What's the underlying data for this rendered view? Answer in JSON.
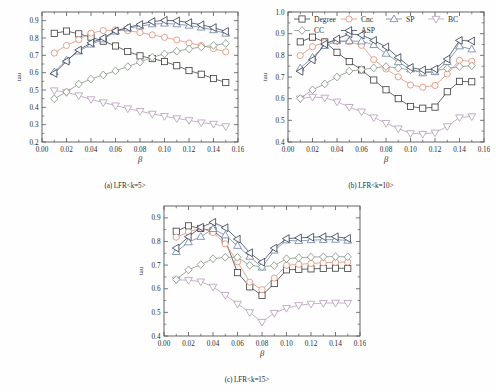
{
  "figure": {
    "xlabel": "β",
    "ylabel": "tau",
    "series_names": [
      "Degree",
      "Cnc",
      "SP",
      "BC",
      "CC",
      "ASP"
    ],
    "series_markers": [
      "square",
      "circle",
      "triangle-up",
      "triangle-down",
      "diamond",
      "triangle-left"
    ],
    "series_colors": [
      "#3a3a3a",
      "#e08a72",
      "#6b7fa3",
      "#b49ab8",
      "#7e917e",
      "#2f3b52"
    ]
  },
  "legend": {
    "row1": [
      "Degree",
      "Cnc",
      "SP",
      "BC"
    ],
    "row2": [
      "CC",
      "ASP"
    ]
  },
  "panels": [
    {
      "id": "a",
      "caption": "(a) LFR<k=5>",
      "xlabel": "β",
      "ylabel": "tau",
      "xticks": [
        "0.00",
        "0.02",
        "0.04",
        "0.06",
        "0.08",
        "0.10",
        "0.12",
        "0.14",
        "0.16"
      ],
      "yticks": [
        "0.2",
        "0.3",
        "0.4",
        "0.5",
        "0.6",
        "0.7",
        "0.8",
        "0.9"
      ]
    },
    {
      "id": "b",
      "caption": "(b) LFR<k=10>",
      "xlabel": "β",
      "ylabel": "tau",
      "xticks": [
        "0.00",
        "0.02",
        "0.04",
        "0.06",
        "0.08",
        "0.10",
        "0.12",
        "0.14",
        "0.16"
      ],
      "yticks": [
        "0.4",
        "0.5",
        "0.6",
        "0.7",
        "0.8",
        "0.9",
        "1.0"
      ]
    },
    {
      "id": "c",
      "caption": "(c) LFR<k=15>",
      "xlabel": "β",
      "ylabel": "tau",
      "xticks": [
        "0.00",
        "0.02",
        "0.04",
        "0.06",
        "0.08",
        "0.10",
        "0.12",
        "0.14",
        "0.16"
      ],
      "yticks": [
        "0.4",
        "0.5",
        "0.6",
        "0.7",
        "0.8",
        "0.9"
      ]
    }
  ],
  "chart_data": [
    {
      "type": "line",
      "panel": "a",
      "title": "(a) LFR<k=5>",
      "xlabel": "β",
      "ylabel": "tau",
      "xlim": [
        0.0,
        0.16
      ],
      "ylim": [
        0.2,
        0.95
      ],
      "grid": false,
      "legend": "none",
      "x": [
        0.01,
        0.02,
        0.03,
        0.04,
        0.05,
        0.06,
        0.07,
        0.08,
        0.09,
        0.1,
        0.11,
        0.12,
        0.13,
        0.14,
        0.15
      ],
      "series": [
        {
          "name": "Degree",
          "marker": "square",
          "color": "#3a3a3a",
          "values": [
            0.827,
            0.84,
            0.824,
            0.805,
            0.782,
            0.754,
            0.722,
            0.697,
            0.681,
            0.664,
            0.64,
            0.612,
            0.591,
            0.566,
            0.543
          ]
        },
        {
          "name": "Cnc",
          "marker": "circle",
          "color": "#e08a72",
          "values": [
            0.713,
            0.757,
            0.79,
            0.828,
            0.843,
            0.846,
            0.842,
            0.832,
            0.818,
            0.804,
            0.789,
            0.771,
            0.757,
            0.739,
            0.72
          ]
        },
        {
          "name": "SP",
          "marker": "triangle-up",
          "color": "#6b7fa3",
          "values": [
            0.604,
            0.672,
            0.723,
            0.763,
            0.793,
            0.838,
            0.856,
            0.868,
            0.88,
            0.884,
            0.88,
            0.872,
            0.861,
            0.846,
            0.826
          ]
        },
        {
          "name": "BC",
          "marker": "triangle-down",
          "color": "#b49ab8",
          "values": [
            0.497,
            0.487,
            0.468,
            0.446,
            0.428,
            0.41,
            0.393,
            0.378,
            0.362,
            0.349,
            0.336,
            0.325,
            0.312,
            0.304,
            0.29
          ]
        },
        {
          "name": "CC",
          "marker": "diamond",
          "color": "#7e917e",
          "values": [
            0.449,
            0.489,
            0.534,
            0.563,
            0.587,
            0.61,
            0.635,
            0.661,
            0.689,
            0.708,
            0.724,
            0.737,
            0.748,
            0.757,
            0.768
          ]
        },
        {
          "name": "ASP",
          "marker": "triangle-left",
          "color": "#2f3b52",
          "values": [
            0.596,
            0.666,
            0.731,
            0.772,
            0.8,
            0.841,
            0.861,
            0.878,
            0.895,
            0.902,
            0.899,
            0.889,
            0.876,
            0.86,
            0.838
          ]
        }
      ]
    },
    {
      "type": "line",
      "panel": "b",
      "title": "(b) LFR<k=10>",
      "xlabel": "β",
      "ylabel": "tau",
      "xlim": [
        0.0,
        0.16
      ],
      "ylim": [
        0.4,
        1.0
      ],
      "grid": false,
      "legend": "top-left",
      "x": [
        0.01,
        0.02,
        0.03,
        0.04,
        0.05,
        0.06,
        0.07,
        0.08,
        0.09,
        0.1,
        0.11,
        0.12,
        0.13,
        0.14,
        0.15
      ],
      "series": [
        {
          "name": "Degree",
          "marker": "square",
          "color": "#3a3a3a",
          "values": [
            0.862,
            0.884,
            0.862,
            0.814,
            0.771,
            0.733,
            0.686,
            0.641,
            0.6,
            0.564,
            0.556,
            0.561,
            0.632,
            0.68,
            0.678
          ]
        },
        {
          "name": "Cnc",
          "marker": "circle",
          "color": "#e08a72",
          "values": [
            0.799,
            0.84,
            0.86,
            0.865,
            0.863,
            0.846,
            0.78,
            0.737,
            0.701,
            0.663,
            0.653,
            0.661,
            0.714,
            0.777,
            0.772
          ]
        },
        {
          "name": "SP",
          "marker": "triangle-up",
          "color": "#6b7fa3",
          "values": [
            0.741,
            0.79,
            0.844,
            0.866,
            0.866,
            0.865,
            0.848,
            0.808,
            0.769,
            0.736,
            0.718,
            0.723,
            0.77,
            0.842,
            0.828
          ]
        },
        {
          "name": "BC",
          "marker": "triangle-down",
          "color": "#b49ab8",
          "values": [
            0.6,
            0.608,
            0.604,
            0.586,
            0.561,
            0.54,
            0.513,
            0.487,
            0.462,
            0.44,
            0.437,
            0.443,
            0.472,
            0.513,
            0.518
          ]
        },
        {
          "name": "CC",
          "marker": "diamond",
          "color": "#7e917e",
          "values": [
            0.601,
            0.641,
            0.668,
            0.7,
            0.727,
            0.734,
            0.742,
            0.748,
            0.741,
            0.733,
            0.722,
            0.728,
            0.74,
            0.748,
            0.752
          ]
        },
        {
          "name": "ASP",
          "marker": "triangle-left",
          "color": "#2f3b52",
          "values": [
            0.726,
            0.779,
            0.852,
            0.876,
            0.899,
            0.894,
            0.869,
            0.839,
            0.79,
            0.744,
            0.733,
            0.737,
            0.783,
            0.869,
            0.866
          ]
        }
      ]
    },
    {
      "type": "line",
      "panel": "c",
      "title": "(c) LFR<k=15>",
      "xlabel": "β",
      "ylabel": "tau",
      "xlim": [
        0.0,
        0.16
      ],
      "ylim": [
        0.4,
        0.95
      ],
      "grid": false,
      "legend": "none",
      "x": [
        0.01,
        0.02,
        0.03,
        0.04,
        0.05,
        0.06,
        0.07,
        0.08,
        0.09,
        0.1,
        0.11,
        0.12,
        0.13,
        0.14,
        0.15
      ],
      "series": [
        {
          "name": "Degree",
          "marker": "square",
          "color": "#3a3a3a",
          "values": [
            0.843,
            0.866,
            0.855,
            0.845,
            0.805,
            0.668,
            0.608,
            0.572,
            0.622,
            0.68,
            0.682,
            0.684,
            0.686,
            0.687,
            0.686
          ]
        },
        {
          "name": "Cnc",
          "marker": "circle",
          "color": "#e08a72",
          "values": [
            0.818,
            0.84,
            0.857,
            0.838,
            0.79,
            0.714,
            0.628,
            0.596,
            0.645,
            0.699,
            0.703,
            0.707,
            0.71,
            0.712,
            0.713
          ]
        },
        {
          "name": "SP",
          "marker": "triangle-up",
          "color": "#6b7fa3",
          "values": [
            0.756,
            0.797,
            0.82,
            0.853,
            0.826,
            0.782,
            0.736,
            0.69,
            0.762,
            0.805,
            0.802,
            0.806,
            0.807,
            0.808,
            0.804
          ]
        },
        {
          "name": "BC",
          "marker": "triangle-down",
          "color": "#b49ab8",
          "values": [
            0.638,
            0.636,
            0.63,
            0.608,
            0.573,
            0.536,
            0.5,
            0.459,
            0.497,
            0.518,
            0.53,
            0.536,
            0.539,
            0.54,
            0.539
          ]
        },
        {
          "name": "CC",
          "marker": "diamond",
          "color": "#7e917e",
          "values": [
            0.639,
            0.68,
            0.702,
            0.727,
            0.733,
            0.733,
            0.699,
            0.693,
            0.698,
            0.727,
            0.731,
            0.734,
            0.735,
            0.736,
            0.735
          ]
        },
        {
          "name": "ASP",
          "marker": "triangle-left",
          "color": "#2f3b52",
          "values": [
            0.772,
            0.82,
            0.86,
            0.881,
            0.858,
            0.81,
            0.752,
            0.712,
            0.772,
            0.812,
            0.815,
            0.818,
            0.82,
            0.82,
            0.813
          ]
        }
      ]
    }
  ]
}
